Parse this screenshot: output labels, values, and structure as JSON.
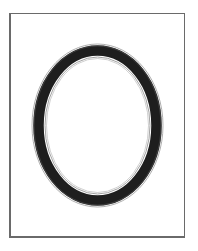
{
  "image": {
    "subject": "oval-ring-frame",
    "colors": {
      "background": "#ffffff",
      "frame_border": "#6a6a6a",
      "ring_fill": "#1e1e1e",
      "ring_outline": "#8a8a8a"
    },
    "frame": {
      "left": 9,
      "top": 13,
      "right": 186,
      "bottom": 239
    },
    "ring": {
      "cx": 97.5,
      "cy": 125.5,
      "outer_rx": 64.5,
      "outer_ry": 80.5,
      "thickness": 11
    }
  }
}
